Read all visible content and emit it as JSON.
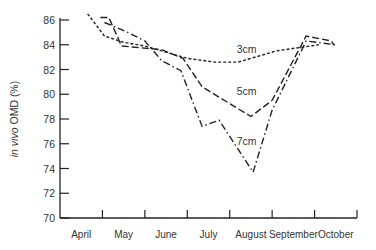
{
  "chart_data": {
    "type": "line",
    "title": "",
    "xlabel": "",
    "ylabel": "in vivo OMD (%)",
    "ylim": [
      70,
      86
    ],
    "yticks": [
      70,
      72,
      74,
      76,
      78,
      80,
      82,
      84,
      86
    ],
    "categories": [
      "April",
      "May",
      "June",
      "July",
      "August",
      "September",
      "October"
    ],
    "grid": false,
    "legend": "inline labels",
    "series": [
      {
        "name": "3cm",
        "style": "short-dash",
        "points": [
          [
            4.15,
            86.5
          ],
          [
            4.55,
            84.7
          ],
          [
            5.0,
            84.2
          ],
          [
            5.5,
            83.9
          ],
          [
            6.0,
            83.4
          ],
          [
            6.5,
            82.9
          ],
          [
            7.15,
            82.6
          ],
          [
            7.7,
            82.6
          ],
          [
            8.6,
            83.5
          ],
          [
            9.6,
            84.0
          ]
        ]
      },
      {
        "name": "5cm",
        "style": "long-dash",
        "points": [
          [
            4.45,
            86.2
          ],
          [
            4.65,
            86.2
          ],
          [
            4.95,
            83.9
          ],
          [
            5.9,
            83.6
          ],
          [
            6.4,
            82.9
          ],
          [
            6.85,
            80.6
          ],
          [
            8.0,
            78.2
          ],
          [
            8.5,
            79.5
          ],
          [
            9.3,
            84.7
          ],
          [
            9.9,
            84.3
          ],
          [
            9.95,
            84.0
          ]
        ]
      },
      {
        "name": "7cm",
        "style": "dash-dot",
        "points": [
          [
            4.55,
            85.8
          ],
          [
            5.1,
            85.0
          ],
          [
            5.5,
            84.3
          ],
          [
            5.9,
            82.7
          ],
          [
            6.35,
            81.9
          ],
          [
            6.85,
            77.4
          ],
          [
            7.25,
            77.9
          ],
          [
            8.05,
            73.7
          ],
          [
            8.5,
            78.7
          ],
          [
            9.3,
            84.3
          ],
          [
            10.0,
            84.0
          ]
        ]
      }
    ],
    "annotations": [
      {
        "text": "3cm",
        "x": 7.9,
        "y": 83.3
      },
      {
        "text": "5cm",
        "x": 7.9,
        "y": 79.9
      },
      {
        "text": "7cm",
        "x": 7.9,
        "y": 75.9
      }
    ]
  }
}
